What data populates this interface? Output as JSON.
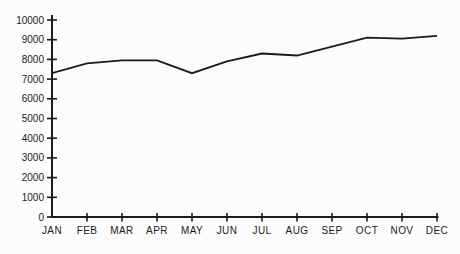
{
  "figure": {
    "background": "#fcfcfc",
    "line_color": "#1b1b1b",
    "text_color": "#1b1b1b"
  },
  "chart_data": {
    "type": "line",
    "categories": [
      "JAN",
      "FEB",
      "MAR",
      "APR",
      "MAY",
      "JUN",
      "JUL",
      "AUG",
      "SEP",
      "OCT",
      "NOV",
      "DEC"
    ],
    "values": [
      7300,
      7800,
      7950,
      7950,
      7300,
      7900,
      8300,
      8200,
      8650,
      9100,
      9050,
      9200
    ],
    "title": "",
    "xlabel": "",
    "ylabel": "",
    "ylim": [
      0,
      10000
    ],
    "ytick_step": 1000,
    "ytick_labels": [
      "0",
      "1000",
      "2000",
      "3000",
      "4000",
      "5000",
      "6000",
      "7000",
      "8000",
      "9000",
      "10000"
    ],
    "grid": false,
    "legend": false
  }
}
